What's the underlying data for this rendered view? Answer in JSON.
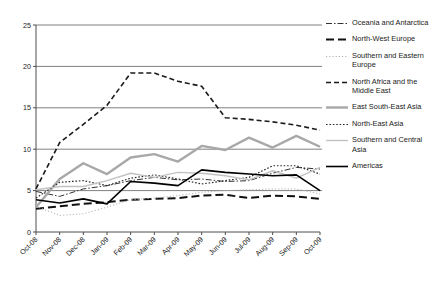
{
  "chart_data": {
    "type": "line",
    "title": "",
    "xlabel": "",
    "ylabel": "",
    "ylim": [
      0,
      25
    ],
    "yticks": [
      0,
      5,
      10,
      15,
      20,
      25
    ],
    "grid": true,
    "legend_position": "right",
    "x": [
      "Oct-08",
      "Nov-08",
      "Dec-08",
      "Jan-09",
      "Feb-09",
      "Mar-09",
      "Apr-09",
      "May-09",
      "Jun-09",
      "Jul-09",
      "Aug-09",
      "Sep-09",
      "Oct-09"
    ],
    "series": [
      {
        "name": "Oceania and Antarctica",
        "style": "dash-dot",
        "color": "#333333",
        "width": 1.0,
        "values": [
          4.9,
          4.3,
          5.2,
          5.6,
          6.2,
          6.6,
          6.3,
          6.4,
          6.1,
          6.2,
          7.1,
          7.8,
          7.6
        ]
      },
      {
        "name": "North-West Europe",
        "style": "long-dash",
        "color": "#111111",
        "width": 2.0,
        "values": [
          2.8,
          3.1,
          3.4,
          3.6,
          3.9,
          4.0,
          4.1,
          4.4,
          4.5,
          4.1,
          4.4,
          4.3,
          4.0
        ]
      },
      {
        "name": "Southern and Eastern Europe",
        "style": "fine-dot",
        "color": "#b3b3b3",
        "width": 1.0,
        "values": [
          3.1,
          2.0,
          2.2,
          3.0,
          3.9,
          4.1,
          4.4,
          4.8,
          5.0,
          5.1,
          5.2,
          5.2,
          4.6
        ]
      },
      {
        "name": "North Africa and the Middle East",
        "style": "dash",
        "color": "#1a1a1a",
        "width": 1.6,
        "values": [
          5.2,
          10.8,
          13.0,
          15.3,
          19.2,
          19.2,
          18.2,
          17.6,
          13.8,
          13.6,
          13.3,
          12.9,
          12.3
        ]
      },
      {
        "name": "East South-East Asia",
        "style": "solid",
        "color": "#a8a8a8",
        "width": 2.4,
        "values": [
          3.0,
          6.4,
          8.3,
          7.0,
          9.0,
          9.4,
          8.5,
          10.4,
          9.9,
          11.4,
          10.2,
          11.6,
          10.3
        ]
      },
      {
        "name": "North-East Asia",
        "style": "dot",
        "color": "#2a2a2a",
        "width": 1.2,
        "values": [
          4.1,
          6.0,
          6.2,
          5.6,
          6.5,
          6.9,
          6.4,
          5.8,
          6.2,
          6.6,
          8.0,
          8.0,
          7.0
        ]
      },
      {
        "name": "Southern and Central Asia",
        "style": "solid",
        "color": "#c2c2c2",
        "width": 1.4,
        "values": [
          5.1,
          5.5,
          5.5,
          6.2,
          7.1,
          6.6,
          7.2,
          7.1,
          6.8,
          6.3,
          7.4,
          6.5,
          7.8
        ]
      },
      {
        "name": "Americas",
        "style": "solid",
        "color": "#000000",
        "width": 1.6,
        "values": [
          3.9,
          3.5,
          4.0,
          3.4,
          6.1,
          5.9,
          5.6,
          7.5,
          7.2,
          7.0,
          6.8,
          6.9,
          5.0
        ]
      }
    ]
  }
}
